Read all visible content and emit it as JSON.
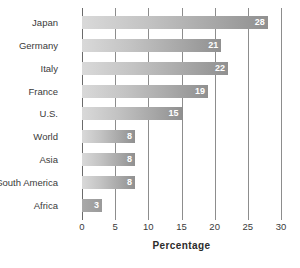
{
  "chart_data": {
    "type": "bar",
    "orientation": "horizontal",
    "title": "",
    "xlabel": "Percentage",
    "ylabel": "",
    "xlim": [
      0,
      30
    ],
    "xticks": [
      0,
      5,
      10,
      15,
      20,
      25,
      30
    ],
    "xtick_labels": [
      "0",
      "5",
      "10",
      "15",
      "20",
      "25",
      "30"
    ],
    "grid": true,
    "grid_axis": "x",
    "legend": false,
    "categories": [
      "Japan",
      "Germany",
      "Italy",
      "France",
      "U.S.",
      "World",
      "Asia",
      "South America",
      "Africa"
    ],
    "values": [
      28,
      21,
      22,
      19,
      15,
      8,
      8,
      8,
      3
    ],
    "value_labels": [
      "28",
      "21",
      "22",
      "19",
      "15",
      "8",
      "8",
      "8",
      "3"
    ],
    "value_label_color": "#ffffff",
    "bar_gradient_start": "#d9d9d9",
    "bar_gradient_end": "#909090",
    "axis_color": "#6b6b6b",
    "gridline_color": "#8d8d8d",
    "background": "#ffffff"
  }
}
